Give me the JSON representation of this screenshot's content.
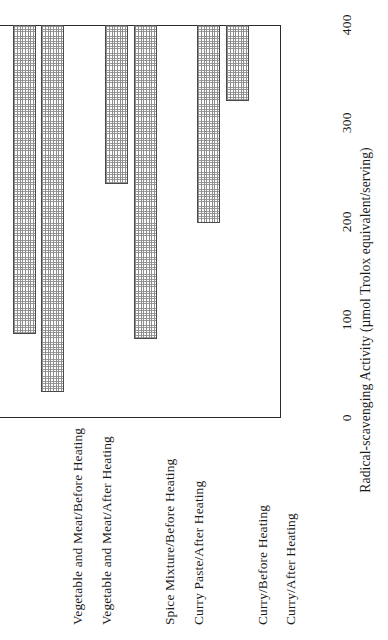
{
  "chart_data": {
    "type": "bar",
    "title": "",
    "subtitle": "",
    "orientation": "vertical-bars-on-rotated-page",
    "categories": [
      "Vegetable and Meat/Before Heating",
      "Vegetable and Meat/After Heating",
      "Spice Mixture/Before Heating",
      "Curry Paste/After Heating",
      "Curry/Before Heating",
      "Curry/After Heating"
    ],
    "values": [
      77,
      202,
      320,
      162,
      374,
      315
    ],
    "xlabel": "",
    "ylabel": "Radical-scavenging Activity (µmol Trolox equivalent/serving)",
    "ylim": [
      0,
      400
    ],
    "yticks": [
      0,
      100,
      200,
      300,
      400
    ],
    "ytick_labels": [
      "0",
      "100",
      "200",
      "300",
      "400"
    ],
    "grid": false,
    "legend": null,
    "bar_fill": "#9a9a9a",
    "bar_edge": "#4a4a4a",
    "axis_color": "#2b2b2b",
    "group_gaps_after_index": [
      1,
      3
    ]
  },
  "axis": {
    "title": "Radical-scavenging Activity (µmol Trolox equivalent/serving)",
    "ticks": [
      {
        "label": "0",
        "value": 0
      },
      {
        "label": "100",
        "value": 100
      },
      {
        "label": "200",
        "value": 200
      },
      {
        "label": "300",
        "value": 300
      },
      {
        "label": "400",
        "value": 400
      }
    ]
  },
  "bars": [
    {
      "label": "Vegetable and Meat/Before Heating",
      "value": 77
    },
    {
      "label": "Vegetable and Meat/After Heating",
      "value": 202
    },
    {
      "label": "Spice Mixture/Before Heating",
      "value": 320
    },
    {
      "label": "Curry Paste/After Heating",
      "value": 162
    },
    {
      "label": "Curry/Before Heating",
      "value": 374
    },
    {
      "label": "Curry/After Heating",
      "value": 315
    }
  ]
}
